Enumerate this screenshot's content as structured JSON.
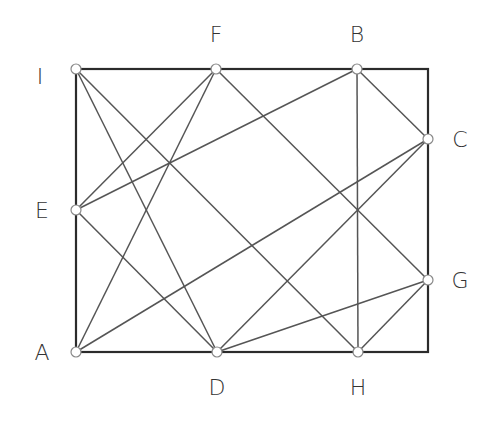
{
  "diagram": {
    "type": "rectangle-grid-reflection",
    "colors": {
      "border": "#2b2b2b",
      "diagonal": "#555555",
      "point_fill": "#ffffff",
      "point_stroke": "#888888",
      "label": "#333333"
    },
    "rectangle": {
      "x1": 76,
      "y1": 69,
      "x2": 428,
      "y2": 352
    },
    "points": [
      {
        "id": "I",
        "label": "I",
        "x": 76,
        "y": 69,
        "lx": 40,
        "ly": 84
      },
      {
        "id": "F",
        "label": "F",
        "x": 216,
        "y": 69,
        "lx": 216,
        "ly": 42
      },
      {
        "id": "B",
        "label": "B",
        "x": 357,
        "y": 69,
        "lx": 357,
        "ly": 42
      },
      {
        "id": "C",
        "label": "C",
        "x": 428,
        "y": 139,
        "lx": 460,
        "ly": 147
      },
      {
        "id": "E",
        "label": "E",
        "x": 76,
        "y": 210,
        "lx": 42,
        "ly": 218
      },
      {
        "id": "G",
        "label": "G",
        "x": 428,
        "y": 280,
        "lx": 460,
        "ly": 288
      },
      {
        "id": "A",
        "label": "A",
        "x": 76,
        "y": 352,
        "lx": 42,
        "ly": 360
      },
      {
        "id": "D",
        "label": "D",
        "x": 217,
        "y": 352,
        "lx": 217,
        "ly": 395
      },
      {
        "id": "H",
        "label": "H",
        "x": 358,
        "y": 352,
        "lx": 358,
        "ly": 395
      }
    ],
    "segments": [
      [
        "A",
        "F"
      ],
      [
        "F",
        "G"
      ],
      [
        "G",
        "H"
      ],
      [
        "H",
        "B"
      ],
      [
        "B",
        "C"
      ],
      [
        "C",
        "D"
      ],
      [
        "D",
        "E"
      ],
      [
        "E",
        "F"
      ],
      [
        "I",
        "H"
      ],
      [
        "A",
        "C"
      ],
      [
        "E",
        "B"
      ],
      [
        "D",
        "G"
      ],
      [
        "I",
        "D"
      ]
    ]
  }
}
